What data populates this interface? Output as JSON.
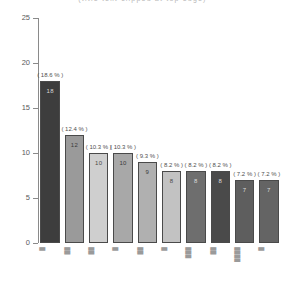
{
  "chart_data": {
    "type": "bar",
    "title": "(title text clipped at top edge)",
    "xlabel": "",
    "ylabel": "",
    "ylim": [
      0,
      25
    ],
    "yticks": [
      0,
      5,
      10,
      15,
      20,
      25
    ],
    "grid": false,
    "legend": null,
    "total": 97,
    "categories": [
      "█",
      "██",
      "██",
      "█",
      "██",
      "█",
      "███",
      "██",
      "████",
      "█"
    ],
    "values": [
      18,
      12,
      10,
      10,
      9,
      8,
      8,
      8,
      7,
      7
    ],
    "percent_labels": [
      "( 18.6 % )",
      "( 12.4 % )",
      "( 10.3 % )",
      "( 10.3 % )",
      "( 9.3 % )",
      "( 8.2 % )",
      "( 8.2 % )",
      "( 8.2 % )",
      "( 7.2 % )",
      "( 7.2 % )"
    ],
    "percents": [
      18.6,
      12.4,
      10.3,
      10.3,
      9.3,
      8.2,
      8.2,
      8.2,
      7.2,
      7.2
    ],
    "value_labels": [
      "18",
      "12",
      "10",
      "10",
      "9",
      "8",
      "8",
      "8",
      "7",
      "7"
    ],
    "bar_colors": [
      "#3d3d3d",
      "#9a9a9a",
      "#cfcfcf",
      "#a8a8a8",
      "#b0b0b0",
      "#c2c2c2",
      "#6e6e6e",
      "#4a4a4a",
      "#5e5e5e",
      "#646464"
    ],
    "value_text_colors": [
      "#d8d8d8",
      "#3a3a3a",
      "#4a4a4a",
      "#3a3a3a",
      "#3a3a3a",
      "#4a4a4a",
      "#dadada",
      "#dadada",
      "#dcdcdc",
      "#dcdcdc"
    ],
    "axis_color": "#8a8a8a",
    "bar_border_color": "#4a4a4a"
  }
}
